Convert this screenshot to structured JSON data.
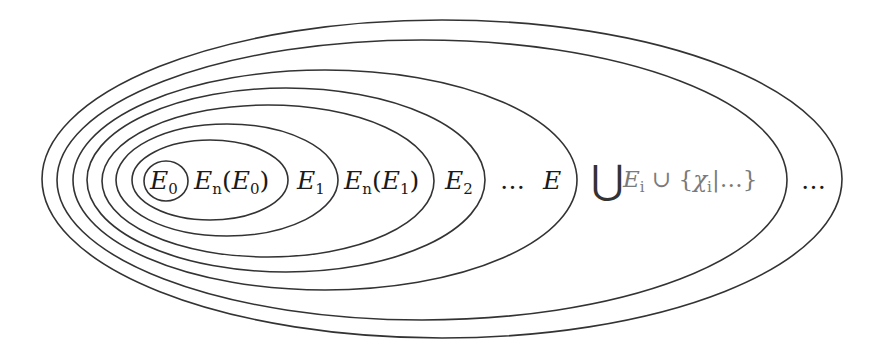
{
  "diagram": {
    "type": "nested-ellipses",
    "stroke_color": "#333333",
    "text_color": "#1a1a1a",
    "muted_text_color": "#7a7a7a",
    "ellipses": [
      {
        "id": "e0",
        "cx": 166,
        "cy": 181,
        "rx": 22,
        "ry": 20
      },
      {
        "id": "en_e0",
        "cx": 210,
        "cy": 180,
        "rx": 78,
        "ry": 40
      },
      {
        "id": "e1",
        "cx": 227,
        "cy": 180,
        "rx": 111,
        "ry": 56
      },
      {
        "id": "en_e1",
        "cx": 268,
        "cy": 181,
        "rx": 166,
        "ry": 76
      },
      {
        "id": "e2",
        "cx": 286,
        "cy": 180,
        "rx": 199,
        "ry": 92
      },
      {
        "id": "e",
        "cx": 325,
        "cy": 180,
        "rx": 252,
        "ry": 110
      },
      {
        "id": "union",
        "cx": 422,
        "cy": 180,
        "rx": 365,
        "ry": 140
      },
      {
        "id": "outer",
        "cx": 442,
        "cy": 179,
        "rx": 400,
        "ry": 159
      }
    ],
    "labels": {
      "e0": {
        "base": "E",
        "sub": "0"
      },
      "en_e0": {
        "base": "E",
        "sub": "n",
        "open": "(",
        "inner_base": "E",
        "inner_sub": "0",
        "close": ")"
      },
      "e1": {
        "base": "E",
        "sub": "1"
      },
      "en_e1": {
        "base": "E",
        "sub": "n",
        "open": "(",
        "inner_base": "E",
        "inner_sub": "1",
        "close": ")"
      },
      "e2": {
        "base": "E",
        "sub": "2"
      },
      "dots_e": "…",
      "e": "E",
      "union_symbol": "⋃",
      "union_term": {
        "base": "E",
        "sub": "i",
        "cup": "∪",
        "open_brace": "{",
        "chi": "χ",
        "chi_sub": "i",
        "bar": "|",
        "dots": "…",
        "close_brace": "}"
      },
      "outer_dots": "…"
    }
  }
}
